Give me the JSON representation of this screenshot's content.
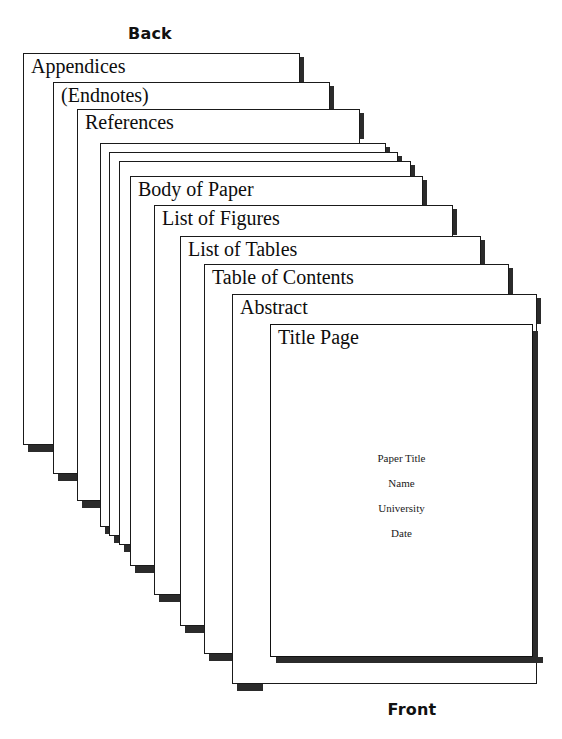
{
  "diagram": {
    "type": "stacked-pages-cascade",
    "back_label": "Back",
    "front_label": "Front",
    "page_count": 12,
    "colors": {
      "page_fill": "#ffffff",
      "page_border": "#1a1a1a",
      "shadow": "#2b2b2b",
      "text": "#0d0d0d",
      "background": "#ffffff"
    }
  },
  "pages": [
    {
      "label": "Appendices",
      "labeled": true,
      "order": 1,
      "left": 23,
      "top": 53,
      "width": 277,
      "height": 392
    },
    {
      "label": "(Endnotes)",
      "labeled": true,
      "order": 2,
      "left": 53,
      "top": 82,
      "width": 277,
      "height": 392
    },
    {
      "label": "References",
      "labeled": true,
      "order": 3,
      "left": 77,
      "top": 109,
      "width": 283,
      "height": 392
    },
    {
      "label": "",
      "labeled": false,
      "order": 4,
      "left": 100,
      "top": 143,
      "width": 286,
      "height": 384
    },
    {
      "label": "",
      "labeled": false,
      "order": 5,
      "left": 109,
      "top": 152,
      "width": 289,
      "height": 384
    },
    {
      "label": "",
      "labeled": false,
      "order": 6,
      "left": 119,
      "top": 161,
      "width": 292,
      "height": 384
    },
    {
      "label": "Body of Paper",
      "labeled": true,
      "order": 7,
      "left": 130,
      "top": 176,
      "width": 293,
      "height": 390
    },
    {
      "label": "List of Figures",
      "labeled": true,
      "order": 8,
      "left": 154,
      "top": 205,
      "width": 299,
      "height": 390
    },
    {
      "label": "List of Tables",
      "labeled": true,
      "order": 9,
      "left": 180,
      "top": 236,
      "width": 301,
      "height": 390
    },
    {
      "label": "Table of Contents",
      "labeled": true,
      "order": 10,
      "left": 204,
      "top": 264,
      "width": 305,
      "height": 390
    },
    {
      "label": "Abstract",
      "labeled": true,
      "order": 11,
      "left": 232,
      "top": 294,
      "width": 305,
      "height": 390
    },
    {
      "label": "Title Page",
      "labeled": true,
      "order": 12,
      "left": 270,
      "top": 324,
      "width": 263,
      "height": 333
    }
  ],
  "title_page": {
    "lines": [
      "Paper Title",
      "Name",
      "University",
      "Date"
    ]
  }
}
